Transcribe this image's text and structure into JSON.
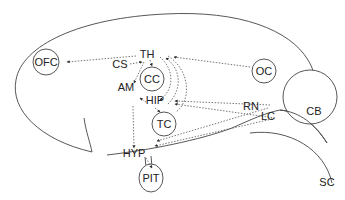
{
  "diagram": {
    "stroke_color": "#333333",
    "regions": {
      "ofc": "OFC",
      "th": "TH",
      "cs": "CS",
      "cc": "CC",
      "am": "AM",
      "hip": "HIP",
      "tc": "TC",
      "hyp": "HYP",
      "pit": "PIT",
      "oc": "OC",
      "rn": "RN",
      "lc": "LC",
      "cb": "CB",
      "sc": "SC"
    },
    "connections": [
      {
        "from": "TH",
        "to": "OFC",
        "style": "dotted"
      },
      {
        "from": "OC",
        "to": "TH",
        "style": "dotted"
      },
      {
        "from": "CS",
        "to": "TH",
        "style": "dotted"
      },
      {
        "from": "TH",
        "to": "AM",
        "style": "dotted"
      },
      {
        "from": "TH",
        "to": "CC",
        "style": "dotted"
      },
      {
        "from": "TH",
        "to": "HIP",
        "style": "dotted"
      },
      {
        "from": "HIP",
        "to": "TH",
        "style": "dotted"
      },
      {
        "from": "HIP",
        "to": "AM",
        "style": "dotted"
      },
      {
        "from": "HIP",
        "to": "TC",
        "style": "dotted"
      },
      {
        "from": "AM",
        "to": "HYP",
        "style": "dotted"
      },
      {
        "from": "RN",
        "to": "HIP",
        "style": "dotted"
      },
      {
        "from": "LC",
        "to": "HIP",
        "style": "dotted"
      },
      {
        "from": "RN",
        "to": "HYP",
        "style": "dotted"
      },
      {
        "from": "LC",
        "to": "HYP",
        "style": "dotted"
      },
      {
        "from": "HYP",
        "to": "PIT",
        "style": "dotted"
      }
    ]
  }
}
